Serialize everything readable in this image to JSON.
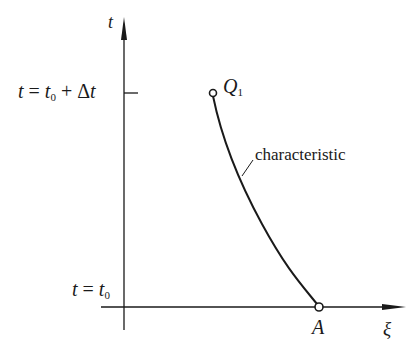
{
  "diagram": {
    "axes": {
      "y_label": "t",
      "x_label": "ξ"
    },
    "ticks": {
      "upper": {
        "lhs": "t",
        "eq": "=",
        "base": "t",
        "sub": "0",
        "plus": "+",
        "delta": "Δ",
        "t": "t"
      },
      "lower": {
        "lhs": "t",
        "eq": "=",
        "base": "t",
        "sub": "0"
      }
    },
    "points": {
      "Q1": {
        "name": "Q",
        "sub": "1"
      },
      "A": {
        "name": "A"
      }
    },
    "curve_label": "characteristic",
    "colors": {
      "line": "#1a1a1a",
      "background": "#ffffff"
    }
  }
}
